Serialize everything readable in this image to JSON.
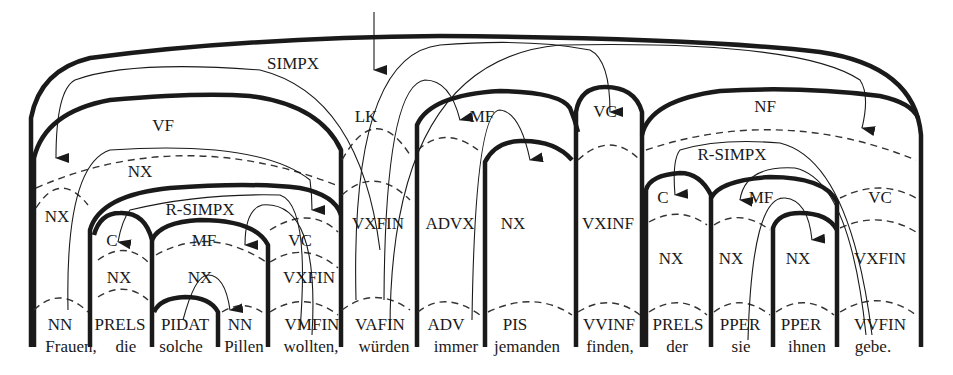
{
  "diagram": {
    "type": "topological-field-parse-tree",
    "root_label": "SIMPX",
    "fields": {
      "vf": "VF",
      "lk": "LK",
      "mf": "MF",
      "vc": "VC",
      "nf": "NF"
    },
    "relative_clause_1": {
      "label": "R-SIMPX",
      "c": "C",
      "mf": "MF",
      "vc": "VC"
    },
    "relative_clause_2": {
      "label": "R-SIMPX",
      "c": "C",
      "mf": "MF",
      "vc": "VC"
    },
    "phrases": {
      "nx_vf": "NX",
      "nx_frauen": "NX",
      "nx_die": "NX",
      "nx_solche_pillen": "NX",
      "vxfin_wollten": "VXFIN",
      "vxfin_wuerden": "VXFIN",
      "advx_immer": "ADVX",
      "nx_jemanden": "NX",
      "vxinf_finden": "VXINF",
      "nx_der": "NX",
      "nx_sie": "NX",
      "nx_ihnen": "NX",
      "vxfin_gebe": "VXFIN"
    },
    "tokens": [
      {
        "word": "Frauen,",
        "pos": "NN"
      },
      {
        "word": "die",
        "pos": "PRELS"
      },
      {
        "word": "solche",
        "pos": "PIDAT"
      },
      {
        "word": "Pillen",
        "pos": "NN"
      },
      {
        "word": "wollten,",
        "pos": "VMFIN"
      },
      {
        "word": "würden",
        "pos": "VAFIN"
      },
      {
        "word": "immer",
        "pos": "ADV"
      },
      {
        "word": "jemanden",
        "pos": "PIS"
      },
      {
        "word": "finden,",
        "pos": "VVINF"
      },
      {
        "word": "der",
        "pos": "PRELS"
      },
      {
        "word": "sie",
        "pos": "PPER"
      },
      {
        "word": "ihnen",
        "pos": "PPER"
      },
      {
        "word": "gebe.",
        "pos": "VVFIN"
      }
    ]
  }
}
